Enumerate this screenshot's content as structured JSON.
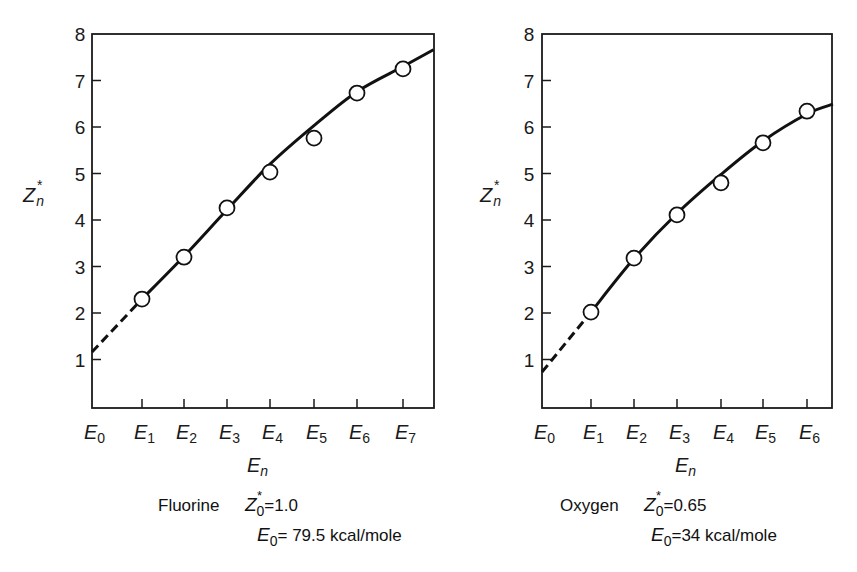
{
  "chart_data": [
    {
      "type": "scatter",
      "panel": "left",
      "element": "Fluorine",
      "xlabel": "E_n",
      "ylabel": "Z_n*",
      "ylim": [
        0,
        8
      ],
      "yticks": [
        1,
        2,
        3,
        4,
        5,
        6,
        7,
        8
      ],
      "xticks": [
        "E0",
        "E1",
        "E2",
        "E3",
        "E4",
        "E5",
        "E6",
        "E7"
      ],
      "grid": false,
      "series": [
        {
          "name": "measured",
          "style": "open-circle",
          "x": [
            "E1",
            "E2",
            "E3",
            "E4",
            "E5",
            "E6",
            "E7"
          ],
          "values": [
            2.3,
            3.2,
            4.26,
            5.03,
            5.76,
            6.73,
            7.25
          ]
        },
        {
          "name": "fit-curve",
          "style": "solid-line",
          "points": [
            [
              1,
              2.3
            ],
            [
              2,
              3.22
            ],
            [
              3,
              4.22
            ],
            [
              4,
              5.2
            ],
            [
              5,
              6.03
            ],
            [
              6,
              6.76
            ],
            [
              7,
              7.3
            ],
            [
              7.7,
              7.66
            ]
          ]
        },
        {
          "name": "extrapolation",
          "style": "dashed-line",
          "points": [
            [
              0,
              1.16
            ],
            [
              1,
              2.3
            ]
          ]
        }
      ],
      "caption": {
        "element_name": "Fluorine",
        "z0_label": "Z",
        "z0_value": "=1.0",
        "e0_label": "E",
        "e0_value": "= 79.5  kcal/mole"
      }
    },
    {
      "type": "scatter",
      "panel": "right",
      "element": "Oxygen",
      "xlabel": "E_n",
      "ylabel": "Z_n*",
      "ylim": [
        0,
        8
      ],
      "yticks": [
        1,
        2,
        3,
        4,
        5,
        6,
        7,
        8
      ],
      "xticks": [
        "E0",
        "E1",
        "E2",
        "E3",
        "E4",
        "E5",
        "E6"
      ],
      "grid": false,
      "series": [
        {
          "name": "measured",
          "style": "open-circle",
          "x": [
            "E1",
            "E2",
            "E3",
            "E4",
            "E5",
            "E6"
          ],
          "values": [
            2.02,
            3.18,
            4.11,
            4.8,
            5.66,
            6.34
          ]
        },
        {
          "name": "fit-curve",
          "style": "solid-line",
          "points": [
            [
              1,
              2.02
            ],
            [
              2,
              3.17
            ],
            [
              3,
              4.14
            ],
            [
              4,
              4.98
            ],
            [
              5,
              5.7
            ],
            [
              6,
              6.28
            ],
            [
              6.6,
              6.49
            ]
          ]
        },
        {
          "name": "extrapolation",
          "style": "dashed-line",
          "points": [
            [
              0,
              0.73
            ],
            [
              1,
              2.02
            ]
          ]
        }
      ],
      "caption": {
        "element_name": "Oxygen",
        "z0_label": "Z",
        "z0_value": "=0.65",
        "e0_label": "E",
        "e0_value": "=34 kcal/mole"
      }
    }
  ],
  "layout": {
    "panels": [
      {
        "left": 92,
        "right": 434,
        "top": 34,
        "bottom": 408,
        "xtick_px": [
          92,
          142,
          184,
          227,
          270,
          314,
          357,
          403
        ],
        "y0_px": 406,
        "px_per_unit": 46.5,
        "ylabel_x": 23,
        "ytick_label_x": 80
      },
      {
        "left": 542,
        "right": 832,
        "top": 34,
        "bottom": 408,
        "xtick_px": [
          542,
          591,
          634,
          677,
          721,
          763,
          807
        ],
        "y0_px": 406,
        "px_per_unit": 46.5,
        "ylabel_x": 480,
        "ytick_label_x": 529
      }
    ]
  }
}
